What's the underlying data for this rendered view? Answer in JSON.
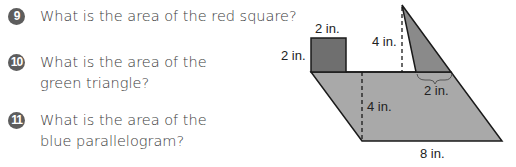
{
  "questions": [
    {
      "number": "9",
      "text": "What is the area of the red square?"
    },
    {
      "number": "10",
      "text": "What is the area of the green triangle?"
    },
    {
      "number": "11",
      "text": "What is the area of the blue parallelogram?"
    }
  ],
  "figure": {
    "labels": {
      "square_top": "2 in.",
      "square_side": "2 in.",
      "triangle_height": "4 in.",
      "triangle_base": "2 in.",
      "parallelogram_height": "4 in.",
      "parallelogram_base": "8 in."
    },
    "colors": {
      "square": "#6f6f6f",
      "triangle": "#8a8a8a",
      "parallelogram": "#a9a9a9",
      "outline": "#1a1a1a",
      "number_badge": "#5d5d5d",
      "text": "#3a3a3a"
    }
  }
}
